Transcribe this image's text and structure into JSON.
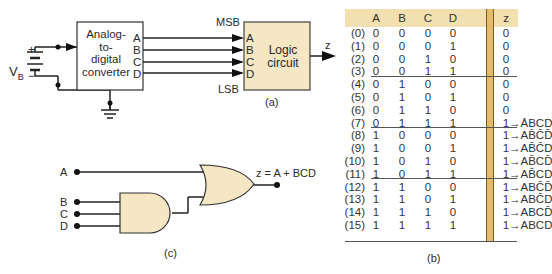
{
  "figure_a": {
    "battery_label": "V",
    "battery_sub": "B",
    "plus": "+",
    "minus": "−",
    "adc_label": [
      "Analog-",
      "to-",
      "digital",
      "converter"
    ],
    "adc_outputs": [
      "A",
      "B",
      "C",
      "D"
    ],
    "logic_label": [
      "Logic",
      "circuit"
    ],
    "logic_inputs": [
      "A",
      "B",
      "C",
      "D"
    ],
    "msb": "MSB",
    "lsb": "LSB",
    "output": "z",
    "caption": "(a)",
    "colors": {
      "logic_fill": "#f5e6c4",
      "adc_fill": "#ffffff"
    }
  },
  "figure_b": {
    "caption": "(b)",
    "headers": [
      "A",
      "B",
      "C",
      "D",
      "z"
    ],
    "rows": [
      {
        "idx": "(0)",
        "A": "0",
        "B": "0",
        "C": "0",
        "D": "0",
        "z": "0",
        "term": ""
      },
      {
        "idx": "(1)",
        "A": "0",
        "B": "0",
        "C": "0",
        "D": "1",
        "z": "0",
        "term": ""
      },
      {
        "idx": "(2)",
        "A": "0",
        "B": "0",
        "C": "1",
        "D": "0",
        "z": "0",
        "term": ""
      },
      {
        "idx": "(3)",
        "A": "0",
        "B": "0",
        "C": "1",
        "D": "1",
        "z": "0",
        "term": ""
      },
      {
        "idx": "(4)",
        "A": "0",
        "B": "1",
        "C": "0",
        "D": "0",
        "z": "0",
        "term": ""
      },
      {
        "idx": "(5)",
        "A": "0",
        "B": "1",
        "C": "0",
        "D": "1",
        "z": "0",
        "term": ""
      },
      {
        "idx": "(6)",
        "A": "0",
        "B": "1",
        "C": "1",
        "D": "0",
        "z": "0",
        "term": ""
      },
      {
        "idx": "(7)",
        "A": "0",
        "B": "1",
        "C": "1",
        "D": "1",
        "z": "1",
        "term": "ĀBCD"
      },
      {
        "idx": "(8)",
        "A": "1",
        "B": "0",
        "C": "0",
        "D": "0",
        "z": "1",
        "term": "AB̄C̄D̄"
      },
      {
        "idx": "(9)",
        "A": "1",
        "B": "0",
        "C": "0",
        "D": "1",
        "z": "1",
        "term": "AB̄C̄D"
      },
      {
        "idx": "(10)",
        "A": "1",
        "B": "0",
        "C": "1",
        "D": "0",
        "z": "1",
        "term": "AB̄CD̄"
      },
      {
        "idx": "(11)",
        "A": "1",
        "B": "0",
        "C": "1",
        "D": "1",
        "z": "1",
        "term": "AB̄CD"
      },
      {
        "idx": "(12)",
        "A": "1",
        "B": "1",
        "C": "0",
        "D": "0",
        "z": "1",
        "term": "ABC̄D̄"
      },
      {
        "idx": "(13)",
        "A": "1",
        "B": "1",
        "C": "0",
        "D": "1",
        "z": "1",
        "term": "ABC̄D"
      },
      {
        "idx": "(14)",
        "A": "1",
        "B": "1",
        "C": "1",
        "D": "0",
        "z": "1",
        "term": "ABCD̄"
      },
      {
        "idx": "(15)",
        "A": "1",
        "B": "1",
        "C": "1",
        "D": "1",
        "z": "1",
        "term": "ABCD"
      }
    ],
    "arrow": "→",
    "colors": {
      "header_fill": "#f3e0b0",
      "z_bar": "#e3bb6a"
    }
  },
  "figure_c": {
    "caption": "(c)",
    "inputs": [
      "A",
      "B",
      "C",
      "D"
    ],
    "output_expr": "z = A + BCD",
    "colors": {
      "gate_fill": "#f5e6c4"
    }
  }
}
